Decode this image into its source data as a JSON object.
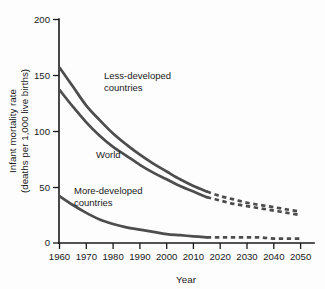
{
  "chart_data": {
    "type": "line",
    "title": "",
    "xlabel": "Year",
    "ylabel": "Infant mortality rate (deaths per 1,000 live births)",
    "ylabel_line1": "Infant mortality rate",
    "ylabel_line2": "(deaths per 1,000 live births)",
    "xlim": [
      1960,
      2050
    ],
    "ylim": [
      0,
      200
    ],
    "grid": false,
    "legend_position": "inline-annotations",
    "projection_starts": 2015,
    "x_ticks": [
      1960,
      1970,
      1980,
      1990,
      2000,
      2010,
      2020,
      2030,
      2040,
      2050
    ],
    "x_tick_labels": [
      "1960",
      "1970",
      "1980",
      "1990",
      "2000",
      "2010",
      "2020",
      "2030",
      "2040",
      "2050"
    ],
    "y_ticks": [
      0,
      50,
      100,
      150,
      200
    ],
    "y_tick_labels": [
      "0",
      "50",
      "100",
      "150",
      "200"
    ],
    "x": [
      1960,
      1965,
      1970,
      1975,
      1980,
      1985,
      1990,
      1995,
      2000,
      2005,
      2010,
      2015,
      2020,
      2025,
      2030,
      2035,
      2040,
      2045,
      2050
    ],
    "series": [
      {
        "name": "Less-developed countries",
        "label": "Less-developed\ncountries",
        "label_line1": "Less-developed",
        "label_line2": "countries",
        "color": "#4d4d4d",
        "values": [
          157,
          140,
          123,
          110,
          98,
          88,
          79,
          71,
          64,
          57,
          51,
          46,
          42,
          39,
          36,
          34,
          32,
          30,
          28
        ]
      },
      {
        "name": "World",
        "label": "World",
        "label_line1": "World",
        "label_line2": "",
        "color": "#4d4d4d",
        "values": [
          137,
          122,
          108,
          96,
          86,
          78,
          70,
          63,
          57,
          51,
          46,
          41,
          38,
          35,
          33,
          31,
          29,
          27,
          25
        ]
      },
      {
        "name": "More-developed countries",
        "label": "More-developed\ncountries",
        "label_line1": "More-developed",
        "label_line2": "countries",
        "color": "#4d4d4d",
        "values": [
          42,
          34,
          27,
          21,
          17,
          14,
          12,
          10,
          8,
          7,
          6,
          5,
          5,
          5,
          5,
          5,
          4,
          4,
          4
        ]
      }
    ]
  },
  "axis": {
    "y_title_line1": "Infant mortality rate",
    "y_title_line2": "(deaths per 1,000 live births)",
    "x_title": "Year"
  },
  "annotations": {
    "less_developed_line1": "Less-developed",
    "less_developed_line2": "countries",
    "world": "World",
    "more_developed_line1": "More-developed",
    "more_developed_line2": "countries"
  },
  "ticks": {
    "y": [
      "200",
      "150",
      "100",
      "50",
      "0"
    ],
    "x": [
      "1960",
      "1970",
      "1980",
      "1990",
      "2000",
      "2010",
      "2020",
      "2030",
      "2040",
      "2050"
    ]
  },
  "colors": {
    "line": "#4d4d4d",
    "axis": "#1a1a1a",
    "background": "#fdfdfd",
    "text": "#1a1a1a"
  }
}
